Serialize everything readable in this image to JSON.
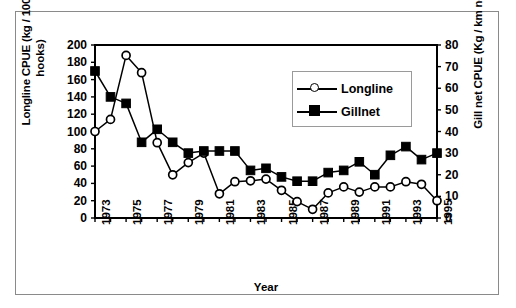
{
  "chart_data": {
    "type": "line",
    "title": "",
    "xlabel": "Year",
    "ylabel": "Longline CPUE (kg / 1000 hooks)",
    "ylabel_right": "Gill net CPUE (Kg / km net)",
    "x": [
      1973,
      1974,
      1975,
      1976,
      1977,
      1978,
      1979,
      1980,
      1981,
      1982,
      1983,
      1984,
      1985,
      1986,
      1987,
      1988,
      1989,
      1990,
      1991,
      1992,
      1993,
      1994,
      1995
    ],
    "xlim": [
      1973,
      1995
    ],
    "xtick_labels": [
      "1973",
      "1975",
      "1977",
      "1979",
      "1981",
      "1983",
      "1985",
      "1987",
      "1989",
      "1991",
      "1993",
      "1995"
    ],
    "xtick_values": [
      1973,
      1975,
      1977,
      1979,
      1981,
      1983,
      1985,
      1987,
      1989,
      1991,
      1993,
      1995
    ],
    "ylim": [
      0,
      200
    ],
    "ytick_labels": [
      "0",
      "20",
      "40",
      "60",
      "80",
      "100",
      "120",
      "140",
      "160",
      "180",
      "200"
    ],
    "ytick_values": [
      0,
      20,
      40,
      60,
      80,
      100,
      120,
      140,
      160,
      180,
      200
    ],
    "ylim_right": [
      0,
      80
    ],
    "ytick_right_labels": [
      "0",
      "10",
      "20",
      "30",
      "40",
      "50",
      "60",
      "70",
      "80"
    ],
    "ytick_right_values": [
      0,
      10,
      20,
      30,
      40,
      50,
      60,
      70,
      80
    ],
    "grid": false,
    "legend_position": "upper-right",
    "series": [
      {
        "name": "Longline",
        "axis": "left",
        "marker": "open-circle",
        "color": "#000000",
        "units": "kg / 1000 hooks",
        "values": [
          100,
          114,
          188,
          168,
          87,
          50,
          64,
          75,
          28,
          42,
          43,
          45,
          32,
          19,
          10,
          29,
          36,
          30,
          36,
          36,
          42,
          39,
          20
        ]
      },
      {
        "name": "Gillnet",
        "axis": "right",
        "marker": "filled-square",
        "color": "#000000",
        "units": "Kg / km net",
        "values": [
          68,
          56,
          53,
          35,
          41,
          35,
          30,
          31,
          31,
          31,
          22,
          23,
          19,
          17,
          17,
          21,
          22,
          26,
          20,
          29,
          33,
          27,
          30
        ]
      }
    ]
  },
  "axes": {
    "ylabel_line1": "Longline CPUE (kg / 1000",
    "ylabel_line2": "hooks)",
    "ylabel_right": "Gill net CPUE (Kg / km net)",
    "xlabel": "Year"
  },
  "legend": {
    "items": [
      {
        "label": "Longline",
        "marker": "open-circle"
      },
      {
        "label": "Gillnet",
        "marker": "filled-square"
      }
    ]
  }
}
